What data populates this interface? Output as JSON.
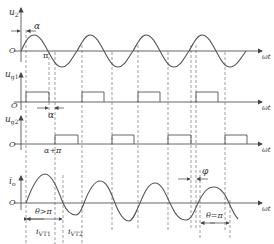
{
  "diagram": {
    "panels": [
      {
        "id": "u2",
        "label": "u",
        "sub": "2",
        "x_label": "ωt",
        "origin": "O"
      },
      {
        "id": "ug1",
        "label": "u",
        "sub": "g1",
        "x_label": "ωt",
        "origin": "O"
      },
      {
        "id": "ug2",
        "label": "u",
        "sub": "g2",
        "x_label": "ωt",
        "origin": "O"
      },
      {
        "id": "io",
        "label": "i",
        "sub": "o",
        "x_label": "ωt",
        "origin": "O"
      }
    ],
    "annotations": {
      "alpha_top": "α",
      "pi": "π",
      "alpha_mid": "α",
      "alpha_plus_pi": "α+π",
      "phi": "φ",
      "theta_gt_pi": "θ>π",
      "theta_eq_pi": "θ=π",
      "ivt1": "i",
      "ivt1_sub": "VT1",
      "ivt2": "i",
      "ivt2_sub": "VT2"
    },
    "colors": {
      "line": "#555555",
      "axis": "#666666",
      "dash": "#777777"
    }
  }
}
